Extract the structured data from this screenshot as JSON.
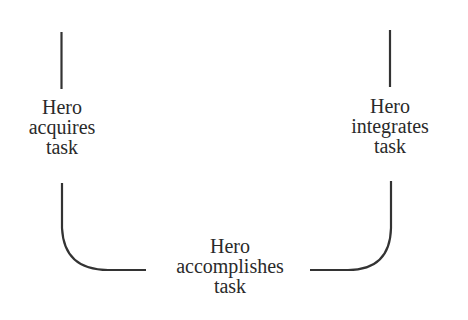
{
  "diagram": {
    "type": "flow",
    "style": "U-shaped stage diagram",
    "stroke_color": "#333333",
    "text_color": "#2a2a2a",
    "background": "#ffffff",
    "nodes": [
      {
        "id": "acquires",
        "lines": [
          "Hero",
          "acquires",
          "task"
        ],
        "position": "left"
      },
      {
        "id": "accomplishes",
        "lines": [
          "Hero",
          "accomplishes",
          "task"
        ],
        "position": "bottom-center"
      },
      {
        "id": "integrates",
        "lines": [
          "Hero",
          "integrates",
          "task"
        ],
        "position": "right"
      }
    ],
    "edges": [
      {
        "from": "top-left",
        "to": "acquires"
      },
      {
        "from": "acquires",
        "to": "accomplishes"
      },
      {
        "from": "accomplishes",
        "to": "integrates"
      },
      {
        "from": "integrates",
        "to": "top-right"
      }
    ]
  }
}
